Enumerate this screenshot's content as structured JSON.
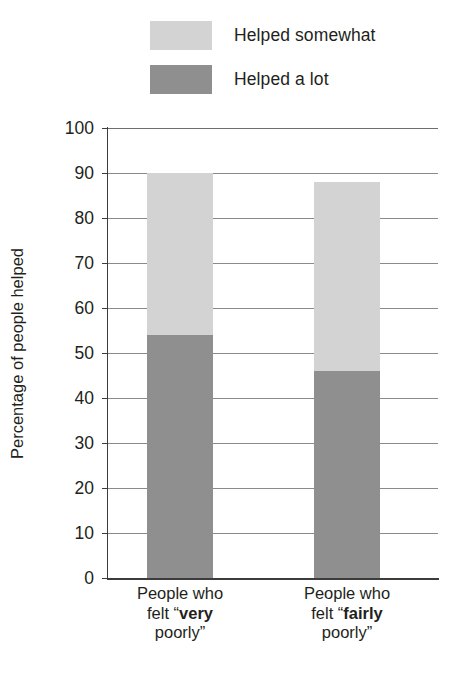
{
  "chart_data": {
    "type": "bar",
    "subtype": "stacked-vertical",
    "title": "",
    "xlabel": "",
    "ylabel": "Percentage of people helped",
    "ylim": [
      0,
      100
    ],
    "ytick_step": 10,
    "yticks": [
      "100",
      "90",
      "80",
      "70",
      "60",
      "50",
      "40",
      "30",
      "20",
      "10",
      "0"
    ],
    "grid": true,
    "grid_orientation": "horizontal",
    "legend_position": "top",
    "categories": [
      {
        "line1": "People who",
        "line2_prefix": "felt “",
        "line2_bold": "very",
        "line3": "poorly”"
      },
      {
        "line1": "People who",
        "line2_prefix": "felt “",
        "line2_bold": "fairly",
        "line3": "poorly”"
      }
    ],
    "category_labels_plain": [
      "People who felt “very poorly”",
      "People who felt “fairly poorly”"
    ],
    "series": [
      {
        "name": "Helped a lot",
        "color": "#8f8f8f",
        "values": [
          54,
          46
        ]
      },
      {
        "name": "Helped somewhat",
        "color": "#d3d3d3",
        "values": [
          36,
          42
        ]
      }
    ],
    "stack_totals": [
      90,
      88
    ],
    "legend_order": [
      "Helped somewhat",
      "Helped a lot"
    ]
  },
  "legend": {
    "items": [
      {
        "label": "Helped somewhat",
        "color": "#d3d3d3"
      },
      {
        "label": "Helped a lot",
        "color": "#8f8f8f"
      }
    ]
  },
  "colors": {
    "helped_somewhat": "#d3d3d3",
    "helped_a_lot": "#8f8f8f",
    "axis": "#3c3c3c",
    "grid": "#8a8a8a",
    "text": "#231f20",
    "background": "#ffffff"
  }
}
